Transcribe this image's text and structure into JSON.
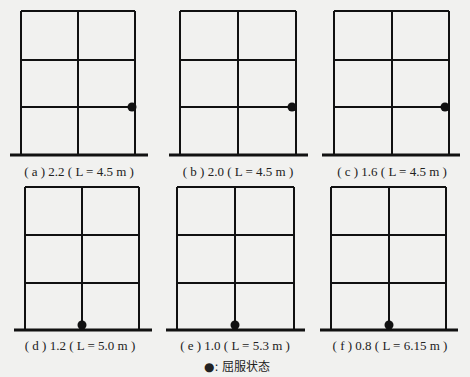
{
  "figure": {
    "panels": [
      {
        "id": "a",
        "label": "( a ) 2.2 ( L = 4.5 m )",
        "ratio": "2.2",
        "L": "4.5 m",
        "left": 21,
        "mid": 78,
        "right": 135,
        "top": 11,
        "floors": [
          60,
          107
        ],
        "ground": 155,
        "gl": 10,
        "gr": 148,
        "hinge": {
          "x": 132,
          "y": 107
        },
        "cap_x": 79,
        "cap_y": 176
      },
      {
        "id": "b",
        "label": "( b ) 2.0 ( L = 4.5 m )",
        "ratio": "2.0",
        "L": "4.5 m",
        "left": 180,
        "mid": 238,
        "right": 296,
        "top": 11,
        "floors": [
          60,
          107
        ],
        "ground": 155,
        "gl": 169,
        "gr": 308,
        "hinge": {
          "x": 292,
          "y": 107
        },
        "cap_x": 238,
        "cap_y": 176
      },
      {
        "id": "c",
        "label": "( c ) 1.6 ( L = 4.5 m )",
        "ratio": "1.6",
        "L": "4.5 m",
        "left": 334,
        "mid": 392,
        "right": 449,
        "top": 11,
        "floors": [
          60,
          107
        ],
        "ground": 155,
        "gl": 322,
        "gr": 460,
        "hinge": {
          "x": 445,
          "y": 107
        },
        "cap_x": 392,
        "cap_y": 176
      },
      {
        "id": "d",
        "label": "( d ) 1.2 ( L = 5.0 m )",
        "ratio": "1.2",
        "L": "5.0 m",
        "left": 25,
        "mid": 82,
        "right": 139,
        "top": 187,
        "floors": [
          235,
          283
        ],
        "ground": 330,
        "gl": 14,
        "gr": 152,
        "hinge": {
          "x": 82,
          "y": 325
        },
        "cap_x": 80,
        "cap_y": 350
      },
      {
        "id": "e",
        "label": "( e ) 1.0 ( L = 5.3 m )",
        "ratio": "1.0",
        "L": "5.3 m",
        "left": 177,
        "mid": 235,
        "right": 294,
        "top": 187,
        "floors": [
          235,
          283
        ],
        "ground": 330,
        "gl": 166,
        "gr": 305,
        "hinge": {
          "x": 235,
          "y": 325
        },
        "cap_x": 235,
        "cap_y": 350
      },
      {
        "id": "f",
        "label": "( f ) 0.8 ( L = 6.15 m )",
        "ratio": "0.8",
        "L": "6.15 m",
        "left": 331,
        "mid": 389,
        "right": 446,
        "top": 187,
        "floors": [
          235,
          283
        ],
        "ground": 330,
        "gl": 320,
        "gr": 458,
        "hinge": {
          "x": 389,
          "y": 325
        },
        "cap_x": 390,
        "cap_y": 350
      }
    ],
    "legend": {
      "symbol": "●",
      "text": "●:  屈服状态",
      "meaning": "yield state"
    },
    "colors": {
      "line": "#111111",
      "background": "#f1f1ef",
      "text": "#222222"
    }
  }
}
